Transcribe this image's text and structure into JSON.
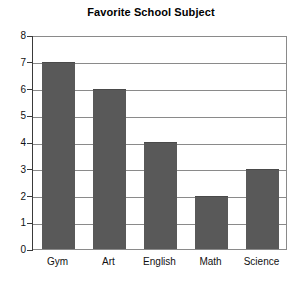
{
  "chart_data": {
    "type": "bar",
    "title": "Favorite School Subject",
    "xlabel": "",
    "ylabel": "",
    "categories": [
      "Gym",
      "Art",
      "English",
      "Math",
      "Science"
    ],
    "values": [
      7,
      6,
      4,
      2,
      3
    ],
    "ylim": [
      0,
      8
    ],
    "yticks": [
      "0",
      "1",
      "2",
      "3",
      "4",
      "5",
      "6",
      "7",
      "8"
    ],
    "grid": "horizontal",
    "legend": "none",
    "colors": {
      "bar_fill": "#595959",
      "bar_edge": "#4a4a4a",
      "gridline": "#8a8a8a",
      "axis": "#3a3a3a",
      "plot_background": "#ffffff",
      "text": "#111111"
    }
  }
}
